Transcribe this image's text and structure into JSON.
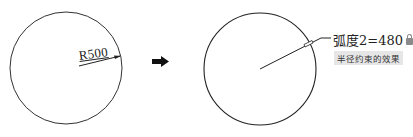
{
  "left_figure": {
    "dimension_label": "R500"
  },
  "transition": {
    "icon": "arrow-right-icon"
  },
  "right_figure": {
    "arc_dimension_label": "弧度2=480",
    "lock_icon": "lock-icon",
    "caption": "半径约束的效果"
  },
  "colors": {
    "stroke": "#222222",
    "caption_bg": "#e6e6e6"
  }
}
